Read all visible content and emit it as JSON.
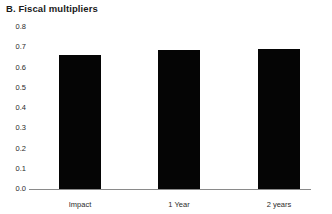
{
  "chart_data": {
    "type": "bar",
    "title": "B. Fiscal multipliers",
    "xlabel": "",
    "ylabel": "",
    "categories": [
      "Impact",
      "1 Year",
      "2 years"
    ],
    "values": [
      0.66,
      0.685,
      0.69
    ],
    "series": [
      {
        "name": "Fiscal multiplier",
        "values": [
          0.66,
          0.685,
          0.69
        ]
      }
    ],
    "ylim": [
      0.0,
      0.8
    ],
    "ytick_labels": [
      "0.8",
      "0.7",
      "0.6",
      "0.5",
      "0.4",
      "0.3",
      "0.2",
      "0.1",
      "0.0"
    ],
    "ytick_values": [
      0.8,
      0.7,
      0.6,
      0.5,
      0.4,
      0.3,
      0.2,
      0.1,
      0.0
    ],
    "grid": false,
    "legend": false,
    "legend_position": "none",
    "bar_color": "#050505",
    "axis_color": "#8a8a8a",
    "annotations": []
  }
}
